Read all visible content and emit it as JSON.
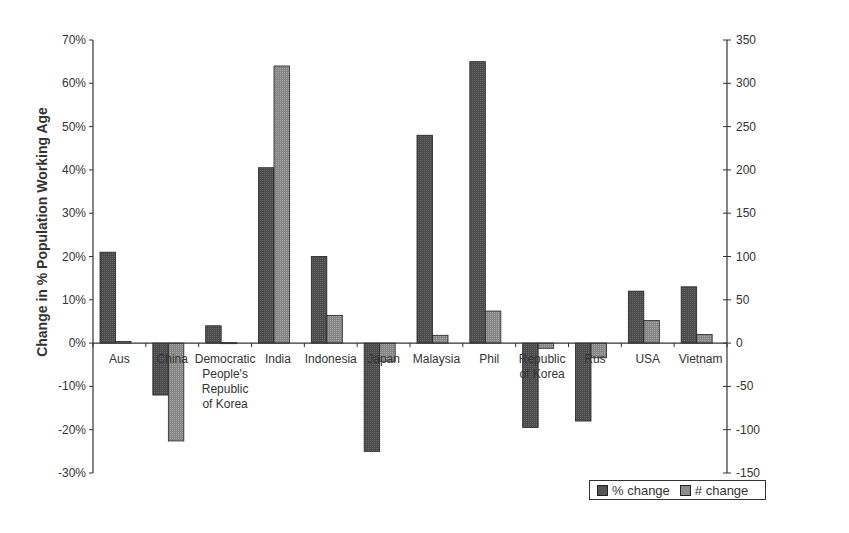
{
  "chart_data": {
    "type": "bar",
    "title": "",
    "xlabel": "",
    "ylabel": "Change in % Population Working Age",
    "ylabel_right": "",
    "ylim": [
      -0.3,
      0.7
    ],
    "ylim_right": [
      -150,
      350
    ],
    "yticks_left": [
      "70%",
      "60%",
      "50%",
      "40%",
      "30%",
      "20%",
      "10%",
      "0%",
      "-10%",
      "-20%",
      "-30%"
    ],
    "yticks_right": [
      "350",
      "300",
      "250",
      "200",
      "150",
      "100",
      "50",
      "0",
      "-50",
      "-100",
      "-150"
    ],
    "grid": false,
    "legend_position": "bottom-right",
    "categories": [
      "Aus",
      "China",
      "Democratic People's Republic of Korea",
      "India",
      "Indonesia",
      "Japan",
      "Malaysia",
      "Phil",
      "Republic of Korea",
      "Rus",
      "USA",
      "Vietnam"
    ],
    "category_label_lines": [
      [
        "Aus"
      ],
      [
        "China"
      ],
      [
        "Democratic",
        "People's",
        "Republic",
        "of Korea"
      ],
      [
        "India"
      ],
      [
        "Indonesia"
      ],
      [
        "Japan"
      ],
      [
        "Malaysia"
      ],
      [
        "Phil"
      ],
      [
        "Republic",
        "of Korea"
      ],
      [
        "Rus"
      ],
      [
        "USA"
      ],
      [
        "Vietnam"
      ]
    ],
    "series": [
      {
        "name": "% change",
        "axis": "left",
        "color": "#555555",
        "values": [
          21,
          -12,
          4,
          40.5,
          20,
          -25,
          48,
          65,
          -19.5,
          -18,
          12,
          13
        ]
      },
      {
        "name": "# change",
        "axis": "right",
        "color": "#8c8c8c",
        "values": [
          2,
          -113,
          0.5,
          320,
          32,
          -21,
          9,
          37,
          -6,
          -17,
          26,
          10
        ]
      }
    ]
  },
  "legend": {
    "items": [
      {
        "label": "% change",
        "color": "#555555"
      },
      {
        "label": "# change",
        "color": "#8c8c8c"
      }
    ]
  }
}
